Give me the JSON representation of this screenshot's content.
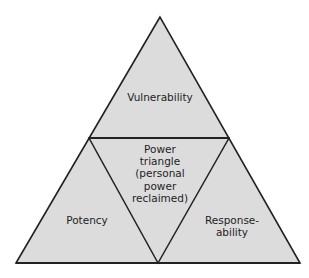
{
  "diagram": {
    "colors": {
      "fill": "#dcdcdc",
      "stroke": "#222222",
      "text": "#1e1e1e",
      "background": "#ffffff"
    },
    "outer_triangle": {
      "apex": [
        160,
        17
      ],
      "bottom_left": [
        16,
        263
      ],
      "bottom_right": [
        300,
        263
      ]
    },
    "inner_triangle": {
      "left": [
        89,
        138
      ],
      "right": [
        229,
        138
      ],
      "bottom": [
        158,
        263
      ]
    },
    "regions": [
      {
        "id": "top",
        "label": "Vulnerability",
        "lines": [
          "Vulnerability"
        ]
      },
      {
        "id": "center",
        "label": "Power triangle (personal power reclaimed)",
        "lines": [
          "Power",
          "triangle",
          "(personal",
          "power",
          "reclaimed)"
        ]
      },
      {
        "id": "left",
        "label": "Potency",
        "lines": [
          "Potency"
        ]
      },
      {
        "id": "right",
        "label": "Response-ability",
        "lines": [
          "Response-",
          "ability"
        ]
      }
    ]
  }
}
